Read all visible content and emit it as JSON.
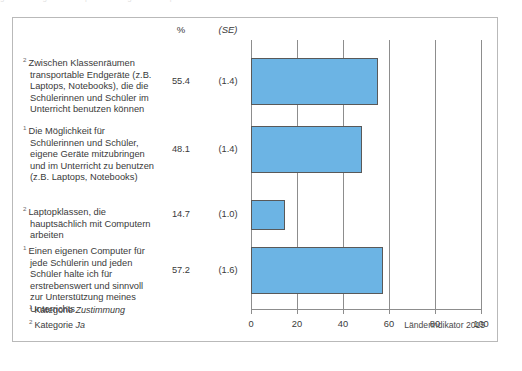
{
  "figure": {
    "columns": {
      "percent_header": "%",
      "se_header": "(SE)"
    },
    "source_note": "Länderindikator 2015",
    "footnotes": [
      {
        "marker": "1",
        "prefix": "Kategorie",
        "term": "Zustimmung"
      },
      {
        "marker": "2",
        "prefix": "Kategorie",
        "term": "Ja"
      }
    ]
  },
  "chart_data": {
    "type": "bar",
    "orientation": "horizontal",
    "title": "",
    "xlabel": "",
    "ylabel": "",
    "xlim": [
      0,
      100
    ],
    "xticks": [
      0,
      20,
      40,
      60,
      80,
      100
    ],
    "grid": true,
    "legend": "none",
    "bar_color": "#6cb4e4",
    "bar_edge_color": "#595959",
    "categories": [
      "Zwischen Klassenräumen transportable Endgeräte (z.B. Laptops, Notebooks), die die Schülerinnen und Schüler im Unterricht benutzen können",
      "Die Möglichkeit für Schülerinnen und Schüler, eigene Geräte mitzubringen und im Unterricht zu benutzen (z.B. Laptops, Notebooks)",
      "Laptopklassen, die hauptsächlich mit Computern arbeiten",
      "Einen eigenen Computer für jede Schülerin und jeden Schüler halte ich für erstrebenswert und sinnvoll zur Unterstützung meines Unterrichts"
    ],
    "values": [
      55.4,
      48.1,
      14.7,
      57.2
    ],
    "value_labels": [
      "55.4",
      "48.1",
      "14.7",
      "57.2"
    ],
    "standard_errors": [
      1.4,
      1.4,
      1.0,
      1.6
    ],
    "se_labels": [
      "(1.4)",
      "(1.4)",
      "(1.0)",
      "(1.6)"
    ],
    "category_markers": [
      "2",
      "1",
      "2",
      "1"
    ]
  }
}
